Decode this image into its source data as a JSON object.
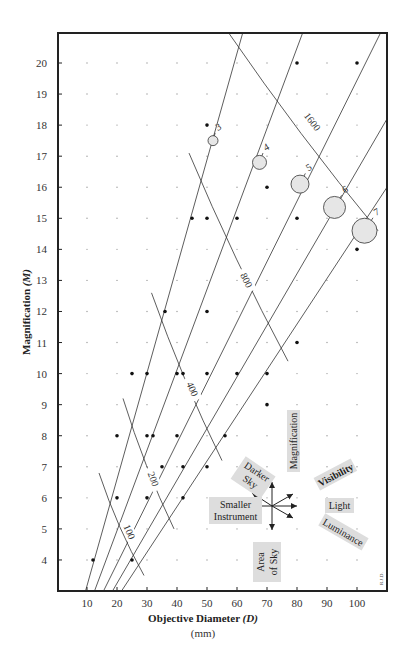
{
  "chart_data": {
    "type": "scatter",
    "title": "",
    "xlabel": "Objective Diameter (D)",
    "xlabel_main": "Objective Diameter ",
    "xlabel_var": "(D)",
    "xunit": "(mm)",
    "ylabel": "Magnification (M)",
    "ylabel_main": "Magnification ",
    "ylabel_var": "(M)",
    "xlim": [
      0,
      110
    ],
    "ylim": [
      3,
      21
    ],
    "xticks": [
      10,
      20,
      30,
      40,
      50,
      60,
      70,
      80,
      90,
      100
    ],
    "yticks": [
      4,
      5,
      6,
      7,
      8,
      9,
      10,
      11,
      12,
      13,
      14,
      15,
      16,
      17,
      18,
      19,
      20
    ],
    "grid": "dot-grid at every 10 mm × 1 magnification",
    "credit": "R.J.D.",
    "points": [
      {
        "x": 12,
        "y": 4
      },
      {
        "x": 25,
        "y": 4
      },
      {
        "x": 20,
        "y": 6
      },
      {
        "x": 30,
        "y": 6
      },
      {
        "x": 42,
        "y": 6
      },
      {
        "x": 35,
        "y": 7
      },
      {
        "x": 42,
        "y": 7
      },
      {
        "x": 50,
        "y": 7
      },
      {
        "x": 20,
        "y": 8
      },
      {
        "x": 30,
        "y": 8
      },
      {
        "x": 32,
        "y": 8
      },
      {
        "x": 40,
        "y": 8
      },
      {
        "x": 56,
        "y": 8
      },
      {
        "x": 70,
        "y": 9
      },
      {
        "x": 25,
        "y": 10
      },
      {
        "x": 30,
        "y": 10
      },
      {
        "x": 40,
        "y": 10
      },
      {
        "x": 42,
        "y": 10
      },
      {
        "x": 50,
        "y": 10
      },
      {
        "x": 60,
        "y": 10
      },
      {
        "x": 70,
        "y": 10
      },
      {
        "x": 80,
        "y": 11
      },
      {
        "x": 36,
        "y": 12
      },
      {
        "x": 50,
        "y": 12
      },
      {
        "x": 100,
        "y": 14
      },
      {
        "x": 45,
        "y": 15
      },
      {
        "x": 50,
        "y": 15
      },
      {
        "x": 60,
        "y": 15
      },
      {
        "x": 80,
        "y": 15
      },
      {
        "x": 70,
        "y": 16
      },
      {
        "x": 50,
        "y": 18
      },
      {
        "x": 80,
        "y": 20
      },
      {
        "x": 100,
        "y": 20
      }
    ],
    "exit_pupil_lines": [
      {
        "label": "3",
        "from": [
          9.5,
          3
        ],
        "to": [
          62,
          21
        ],
        "circle": {
          "x": 52,
          "y": 17.5,
          "r": 5
        }
      },
      {
        "label": "4",
        "from": [
          12.5,
          3
        ],
        "to": [
          82,
          21
        ],
        "circle": {
          "x": 67.5,
          "y": 16.8,
          "r": 7
        }
      },
      {
        "label": "5",
        "from": [
          15.5,
          3
        ],
        "to": [
          108,
          21
        ],
        "circle": {
          "x": 81,
          "y": 16.1,
          "r": 9
        }
      },
      {
        "label": "6",
        "from": [
          18.5,
          3
        ],
        "to": [
          110,
          18.2
        ],
        "circle": {
          "x": 92.5,
          "y": 15.35,
          "r": 11
        }
      },
      {
        "label": "7",
        "from": [
          21.5,
          3
        ],
        "to": [
          110,
          16
        ],
        "circle": {
          "x": 102.5,
          "y": 14.6,
          "r": 12.5
        }
      }
    ],
    "brightness_curves": [
      {
        "label": "100",
        "from": [
          14,
          6.8
        ],
        "to": [
          29,
          3.5
        ],
        "label_at": [
          24,
          4.9
        ]
      },
      {
        "label": "200",
        "from": [
          22,
          9.2
        ],
        "to": [
          39,
          5
        ],
        "label_at": [
          32,
          6.6
        ]
      },
      {
        "label": "400",
        "from": [
          31.5,
          12.6
        ],
        "to": [
          55,
          7.2
        ],
        "label_at": [
          45,
          9.5
        ]
      },
      {
        "label": "800",
        "from": [
          44,
          17.1
        ],
        "to": [
          77,
          10.4
        ],
        "label_at": [
          63,
          13
        ]
      },
      {
        "label": "1600",
        "from": [
          57,
          21
        ],
        "to": [
          107,
          14.6
        ],
        "label_at": [
          85,
          18.1
        ]
      }
    ],
    "direction_legend": {
      "up": "Magnification",
      "up_right": "Visibility",
      "right": "Light",
      "down_right": "Luminance",
      "down": "Area of Sky",
      "down_line1": "Area",
      "down_line2": "of Sky",
      "left": "Smaller Instrument",
      "left_line1": "Smaller",
      "left_line2": "Instrument",
      "up_left": "Darker Sky",
      "up_left_line1": "Darker",
      "up_left_line2": "Sky"
    },
    "colors": {
      "frame": "#222222",
      "line": "#333333",
      "circle_fill": "#e6e6e6",
      "label_box": "#dddddd",
      "grid_dot": "#999999"
    }
  }
}
